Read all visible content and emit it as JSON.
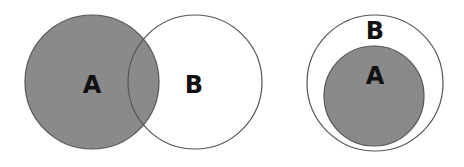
{
  "colors": {
    "shaded_fill": "#8a8a8a",
    "shaded_stroke": "#555555",
    "empty_fill": "#ffffff",
    "empty_stroke": "#555555"
  },
  "diagrams": [
    {
      "name": "overlapping-sets",
      "circles": [
        {
          "label": "A",
          "shaded": true
        },
        {
          "label": "B",
          "shaded": false
        }
      ]
    },
    {
      "name": "subset",
      "circles": [
        {
          "label": "B",
          "shaded": false
        },
        {
          "label": "A",
          "shaded": true
        }
      ]
    }
  ]
}
